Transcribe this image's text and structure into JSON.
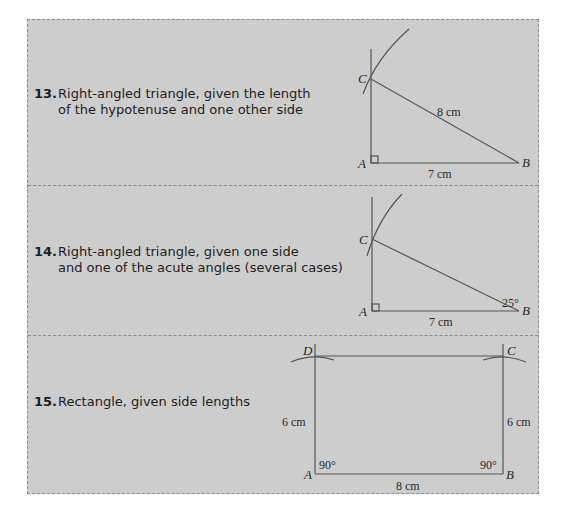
{
  "items": [
    {
      "number": "13.",
      "line1": "Right-angled triangle, given the length",
      "line2": "of the hypotenuse and one other side",
      "figure": {
        "type": "right-triangle",
        "vertices": {
          "A": "A",
          "B": "B",
          "C": "C"
        },
        "labels": {
          "hypotenuse": "8 cm",
          "base": "7 cm"
        }
      }
    },
    {
      "number": "14.",
      "line1": "Right-angled triangle, given one side",
      "line2": "and one of the acute angles (several cases)",
      "figure": {
        "type": "right-triangle",
        "vertices": {
          "A": "A",
          "B": "B",
          "C": "C"
        },
        "labels": {
          "base": "7 cm",
          "angle_B": "25°"
        }
      }
    },
    {
      "number": "15.",
      "line1": "Rectangle, given side lengths",
      "line2": "",
      "figure": {
        "type": "rectangle",
        "vertices": {
          "A": "A",
          "B": "B",
          "C": "C",
          "D": "D"
        },
        "labels": {
          "left": "6 cm",
          "right": "6 cm",
          "bottom": "8 cm",
          "angle_A": "90°",
          "angle_B": "90°"
        }
      }
    }
  ],
  "colors": {
    "panel_bg": "#cdcdcd",
    "border": "#8a8a8a",
    "line": "#555555",
    "text": "#1e1e1e"
  }
}
